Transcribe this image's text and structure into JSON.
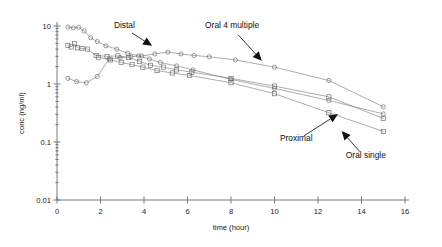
{
  "chart_data": {
    "type": "line",
    "title": "",
    "xlabel": "time (hour)",
    "ylabel": "conc (ng/ml)",
    "yscale": "log",
    "xlim": [
      0,
      16
    ],
    "ylim": [
      0.01,
      10
    ],
    "grid": false,
    "legend_position": "inline-annotations",
    "xticks": [
      0,
      2,
      4,
      6,
      8,
      10,
      12,
      14,
      16
    ],
    "xtick_labels": [
      "0",
      "2",
      "4",
      "6",
      "8",
      "10",
      "12",
      "14",
      "16"
    ],
    "yticks": [
      0.01,
      0.1,
      1,
      10
    ],
    "ytick_labels": [
      "0.01",
      "0.1",
      "1",
      "10"
    ],
    "annotations": [
      {
        "text": "Distal",
        "x": 3.1,
        "y": 9.2,
        "arrow_to_x": 4.35,
        "arrow_to_y": 4.6
      },
      {
        "text": "Oral 4 multiple",
        "x": 8.05,
        "y": 9.2,
        "arrow_to_x": 9.4,
        "arrow_to_y": 2.55
      },
      {
        "text": "Proximal",
        "x": 11.0,
        "y": 0.105,
        "arrow_to_x": 12.9,
        "arrow_to_y": 0.3
      },
      {
        "text": "Oral single",
        "x": 14.2,
        "y": 0.052,
        "arrow_to_x": 13.1,
        "arrow_to_y": 0.152
      }
    ],
    "series": [
      {
        "name": "Distal",
        "marker": "circle",
        "points": [
          [
            0.5,
            9.6
          ],
          [
            0.75,
            9.3
          ],
          [
            1.0,
            9.5
          ],
          [
            1.25,
            8.2
          ],
          [
            1.55,
            6.3
          ],
          [
            1.85,
            5.4
          ],
          [
            2.25,
            4.55
          ],
          [
            2.75,
            4.0
          ],
          [
            3.25,
            3.4
          ],
          [
            3.75,
            3.05
          ],
          [
            4.25,
            2.7
          ],
          [
            4.75,
            2.35
          ],
          [
            5.5,
            2.05
          ],
          [
            6.25,
            1.75
          ],
          [
            8.0,
            1.2
          ],
          [
            10.0,
            0.84
          ],
          [
            12.5,
            0.52
          ],
          [
            15.0,
            0.305
          ]
        ]
      },
      {
        "name": "Proximal",
        "marker": "square",
        "points": [
          [
            0.5,
            4.6
          ],
          [
            0.65,
            4.35
          ],
          [
            0.8,
            4.95
          ],
          [
            0.95,
            4.2
          ],
          [
            1.15,
            4.1
          ],
          [
            1.4,
            4.0
          ],
          [
            1.8,
            3.1
          ],
          [
            2.3,
            3.0
          ],
          [
            2.8,
            3.05
          ],
          [
            3.3,
            2.85
          ],
          [
            3.8,
            2.45
          ],
          [
            4.3,
            2.1
          ],
          [
            4.9,
            1.95
          ],
          [
            5.5,
            1.75
          ],
          [
            6.2,
            1.6
          ],
          [
            8.0,
            1.25
          ],
          [
            10.0,
            0.92
          ],
          [
            12.5,
            0.6
          ],
          [
            15.0,
            0.255
          ]
        ]
      },
      {
        "name": "Oral 4 multiple",
        "marker": "circle",
        "points": [
          [
            0.5,
            1.25
          ],
          [
            0.9,
            1.1
          ],
          [
            1.35,
            1.05
          ],
          [
            1.85,
            1.35
          ],
          [
            2.4,
            2.7
          ],
          [
            2.9,
            2.85
          ],
          [
            3.4,
            2.95
          ],
          [
            3.9,
            3.05
          ],
          [
            4.5,
            3.3
          ],
          [
            5.1,
            3.55
          ],
          [
            5.7,
            3.3
          ],
          [
            6.3,
            3.1
          ],
          [
            7.0,
            2.95
          ],
          [
            8.2,
            2.6
          ],
          [
            10.0,
            1.95
          ],
          [
            12.5,
            1.15
          ],
          [
            15.0,
            0.405
          ]
        ]
      },
      {
        "name": "Oral single",
        "marker": "square",
        "points": [
          [
            1.9,
            2.9
          ],
          [
            2.45,
            2.6
          ],
          [
            2.95,
            2.35
          ],
          [
            3.45,
            2.15
          ],
          [
            3.95,
            1.95
          ],
          [
            4.6,
            1.7
          ],
          [
            5.3,
            1.55
          ],
          [
            6.1,
            1.4
          ],
          [
            8.0,
            1.05
          ],
          [
            10.0,
            0.68
          ],
          [
            12.5,
            0.32
          ],
          [
            15.0,
            0.152
          ]
        ]
      }
    ]
  }
}
